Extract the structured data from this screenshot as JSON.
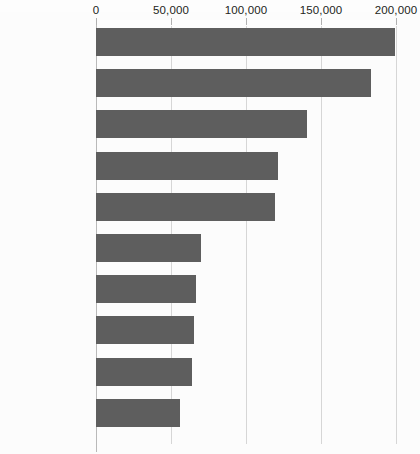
{
  "chart_data": {
    "type": "bar",
    "orientation": "horizontal",
    "title": "",
    "xlabel": "",
    "ylabel": "",
    "xlim": [
      0,
      200000
    ],
    "xticks": [
      0,
      50000,
      100000,
      150000,
      200000
    ],
    "xtick_labels": [
      "0",
      "50,000",
      "100,000",
      "150,000",
      "200,000"
    ],
    "grid": true,
    "legend": false,
    "bar_color": "#5e5e5e",
    "gridline_color": "#d6d6d6",
    "background_color": "#fcfcfc",
    "categories": [
      "Zaatari, Jordan",
      "Kakuma, Kenya",
      "Hagadera, Kenya",
      "Dagahaley, Kenya",
      "Ifo, Kenya",
      "Yida, South Sudan",
      "Panian, Pakistan",
      "Pugnido, Ethiopia",
      "Mishamo, Tanzania",
      "Katumba, Tanzania"
    ],
    "values": [
      199000,
      183000,
      140500,
      121500,
      119000,
      70000,
      66500,
      65000,
      64000,
      56000
    ]
  }
}
